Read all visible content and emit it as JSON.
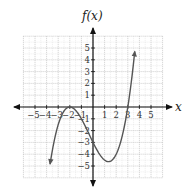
{
  "chart_data": {
    "type": "line",
    "title": "",
    "xlabel": "x",
    "ylabel": "f(x)",
    "xlim": [
      -6,
      6
    ],
    "ylim": [
      -6,
      6
    ],
    "grid": true,
    "x_ticks": [
      -5,
      -4,
      -3,
      -2,
      -1,
      1,
      2,
      3,
      4,
      5
    ],
    "x_tick_labels": [
      "−5",
      "−4",
      "−3",
      "−2",
      "−1",
      "1",
      "2",
      "3",
      "4",
      "5"
    ],
    "y_ticks": [
      -5,
      -4,
      -3,
      -2,
      -1,
      1,
      2,
      3,
      4,
      5
    ],
    "y_tick_labels": [
      "−5",
      "−4",
      "−3",
      "−2",
      "−1",
      "1",
      "2",
      "3",
      "4",
      "5"
    ],
    "series": [
      {
        "name": "f(x)",
        "description": "cubic polynomial with double root at x=-2 and root at x=3, y-intercept -3, local max (-2,0), local min about (1.33,-4.63)",
        "x": [
          -3.7,
          -3.5,
          -3,
          -2.5,
          -2,
          -1.5,
          -1,
          -0.5,
          0,
          0.5,
          1,
          1.33,
          1.5,
          2,
          2.5,
          3,
          3.3,
          3.6
        ],
        "y": [
          -4.84,
          -3.66,
          -1.5,
          -0.34,
          0,
          -0.28,
          -1,
          -1.97,
          -3,
          -3.94,
          -4.5,
          -4.63,
          -4.59,
          -4,
          -2.53,
          0,
          2.01,
          4.7
        ],
        "color": "#555555",
        "arrow_ends": true
      }
    ],
    "legend": null
  },
  "labels": {
    "y_axis_title": "f(x)",
    "x_axis_title": "x"
  }
}
